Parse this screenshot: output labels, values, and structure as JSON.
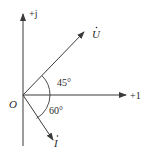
{
  "diagram": {
    "type": "phasor",
    "axes": {
      "real_label": "+1",
      "imag_label": "+j",
      "origin_label": "O"
    },
    "phasors": [
      {
        "name": "U",
        "label": "U",
        "angle_deg": 45,
        "direction": "above real axis"
      },
      {
        "name": "I",
        "label": "I",
        "angle_deg": -60,
        "direction": "below real axis"
      }
    ],
    "angles": [
      {
        "label": "45°",
        "between": [
          "+1",
          "U"
        ]
      },
      {
        "label": "60°",
        "between": [
          "+1",
          "I"
        ]
      }
    ],
    "colors": {
      "line": "#3a3a3a",
      "text": "#2a2a2a",
      "background": "#ffffff"
    }
  }
}
